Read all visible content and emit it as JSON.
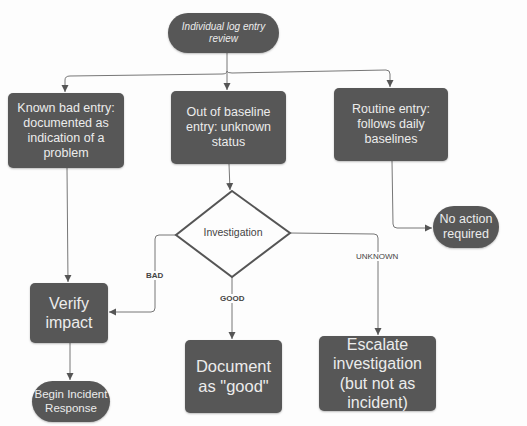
{
  "diagram": {
    "type": "flowchart",
    "nodes": {
      "start": {
        "label": "Individual log entry review",
        "shape": "terminator"
      },
      "known_bad": {
        "label": "Known bad entry: documented as indication of a problem",
        "shape": "process"
      },
      "out_of_baseline": {
        "label": "Out of baseline entry: unknown status",
        "shape": "process"
      },
      "routine": {
        "label": "Routine entry: follows daily baselines",
        "shape": "process"
      },
      "investigation": {
        "label": "Investigation",
        "shape": "decision"
      },
      "no_action": {
        "label": "No action required",
        "shape": "terminator"
      },
      "verify_impact": {
        "label": "Verify impact",
        "shape": "process"
      },
      "begin_incident": {
        "label": "Begin Incident Response",
        "shape": "terminator"
      },
      "document_good": {
        "label": "Document as \"good\"",
        "shape": "process"
      },
      "escalate": {
        "label": "Escalate investigation (but not as incident)",
        "shape": "process"
      }
    },
    "edge_labels": {
      "bad": "BAD",
      "good": "GOOD",
      "unknown": "UNKNOWN"
    },
    "edges": [
      {
        "from": "start",
        "to": "known_bad"
      },
      {
        "from": "start",
        "to": "out_of_baseline"
      },
      {
        "from": "start",
        "to": "routine"
      },
      {
        "from": "known_bad",
        "to": "verify_impact"
      },
      {
        "from": "out_of_baseline",
        "to": "investigation"
      },
      {
        "from": "routine",
        "to": "no_action"
      },
      {
        "from": "investigation",
        "to": "verify_impact",
        "label": "BAD"
      },
      {
        "from": "investigation",
        "to": "document_good",
        "label": "GOOD"
      },
      {
        "from": "investigation",
        "to": "escalate",
        "label": "UNKNOWN"
      },
      {
        "from": "verify_impact",
        "to": "begin_incident"
      }
    ],
    "colors": {
      "node_fill": "#575757",
      "node_text": "#ececec",
      "edge": "#666666",
      "background": "#fdfdfd"
    }
  }
}
